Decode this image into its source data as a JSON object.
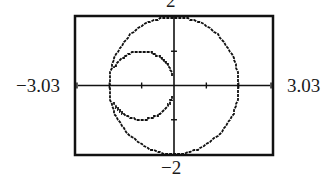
{
  "chart_data": {
    "type": "line",
    "title": "",
    "window": {
      "xmin": -3.03,
      "xmax": 3.03,
      "ymin": -2,
      "ymax": 2,
      "xscl": 1,
      "yscl": 1
    },
    "labels": {
      "xmin": "−3.03",
      "xmax": "3.03",
      "ymin": "−2",
      "ymax": "2"
    },
    "xlabel": "",
    "ylabel": "",
    "grid": false,
    "legend": null,
    "series": [
      {
        "name": "outer circle",
        "kind": "circle",
        "center": [
          0,
          0
        ],
        "radius": 2,
        "theta_range_deg": [
          0,
          360
        ]
      },
      {
        "name": "inner circle (partial)",
        "kind": "circle",
        "center": [
          -1,
          0
        ],
        "radius": 1,
        "arcs_deg": [
          [
            15,
            150
          ],
          [
            210,
            342
          ]
        ]
      }
    ],
    "x_ticks": [
      -3,
      -2,
      -1,
      1,
      2,
      3
    ],
    "y_ticks": [
      -1,
      1
    ],
    "colors": {
      "frame": "#111111",
      "curve": "#111111",
      "axes": "#111111",
      "background": "#ffffff"
    }
  }
}
